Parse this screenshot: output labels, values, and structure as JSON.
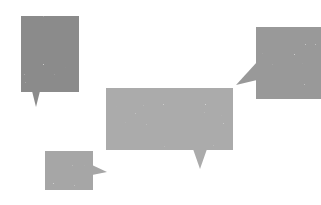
{
  "canvas": {
    "width": 321,
    "height": 205,
    "background": "#ffffff"
  },
  "bubbles": [
    {
      "id": "bubble-top-left",
      "color": "#8b8b8b",
      "rect": {
        "x": 21,
        "y": 16,
        "w": 58,
        "h": 76
      },
      "tail": {
        "direction": "down",
        "points": [
          [
            32,
            91
          ],
          [
            40,
            91
          ],
          [
            36,
            107
          ]
        ]
      }
    },
    {
      "id": "bubble-top-right",
      "color": "#999999",
      "rect": {
        "x": 256,
        "y": 27,
        "w": 65,
        "h": 72
      },
      "tail": {
        "direction": "left",
        "points": [
          [
            257,
            62
          ],
          [
            257,
            80
          ],
          [
            236,
            85
          ]
        ]
      }
    },
    {
      "id": "bubble-center",
      "color": "#ababab",
      "rect": {
        "x": 106,
        "y": 88,
        "w": 127,
        "h": 62
      },
      "tail": {
        "direction": "down",
        "points": [
          [
            193,
            149
          ],
          [
            207,
            149
          ],
          [
            200,
            169
          ]
        ]
      }
    },
    {
      "id": "bubble-bottom-left",
      "color": "#a6a6a6",
      "rect": {
        "x": 45,
        "y": 151,
        "w": 48,
        "h": 39
      },
      "tail": {
        "direction": "right",
        "points": [
          [
            92,
            165
          ],
          [
            92,
            175
          ],
          [
            107,
            172
          ]
        ]
      }
    }
  ]
}
